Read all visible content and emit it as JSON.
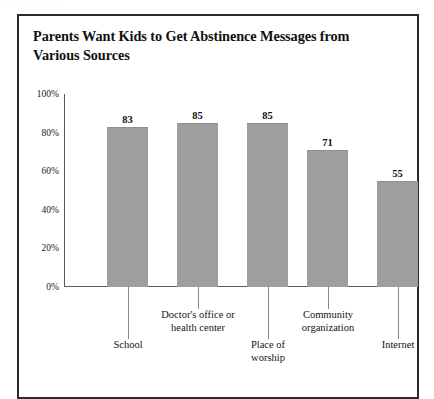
{
  "page": {
    "scan_artifact_text": ". . .   .   .     .      .    ."
  },
  "figure": {
    "title": "Parents Want Kids to Get Abstinence Messages from Various Sources"
  },
  "chart_data": {
    "type": "bar",
    "title": "Parents Want Kids to Get Abstinence Messages from Various Sources",
    "xlabel": "",
    "ylabel": "",
    "ylim": [
      0,
      100
    ],
    "grid": false,
    "legend": false,
    "categories": [
      "School",
      "Doctor's office or health center",
      "Place of worship",
      "Community organization",
      "Internet"
    ],
    "values": [
      83,
      85,
      85,
      71,
      55
    ],
    "value_labels": [
      "83",
      "85",
      "85",
      "71",
      "55"
    ],
    "ytick_labels": [
      "100%",
      "80%",
      "60%",
      "40%",
      "20%",
      "0%"
    ],
    "ytick_values": [
      100,
      80,
      60,
      40,
      20,
      0
    ],
    "bar_color": "#9e9e9e",
    "axis_color": "#5a5a5a",
    "label_rows": [
      "bottom",
      "top",
      "bottom",
      "top",
      "bottom"
    ]
  }
}
